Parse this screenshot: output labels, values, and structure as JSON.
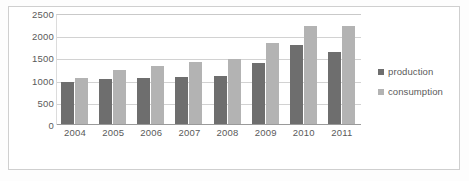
{
  "figure": {
    "background_color": "#fdfdfd",
    "frame_color": "#cfcfcf"
  },
  "chart_data": {
    "type": "bar",
    "title": "",
    "subtitle": "",
    "xlabel": "",
    "ylabel": "",
    "categories": [
      "2004",
      "2005",
      "2006",
      "2007",
      "2008",
      "2009",
      "2010",
      "2011"
    ],
    "series": [
      {
        "name": "production",
        "color": "#6e6e6e",
        "values": [
          980,
          1040,
          1070,
          1080,
          1100,
          1400,
          1800,
          1650
        ]
      },
      {
        "name": "consumption",
        "color": "#b3b3b3",
        "values": [
          1060,
          1240,
          1340,
          1430,
          1480,
          1840,
          2230,
          2220
        ]
      }
    ],
    "ylim": [
      0,
      2500
    ],
    "yticks": [
      0,
      500,
      1000,
      1500,
      2000,
      2500
    ],
    "ytick_labels": [
      "0",
      "500",
      "1000",
      "1500",
      "2000",
      "2500"
    ],
    "grid": true,
    "grid_axis": "y",
    "legend": true,
    "legend_position": "right"
  },
  "legend": {
    "entries": [
      {
        "label": "production",
        "color": "#6e6e6e"
      },
      {
        "label": "consumption",
        "color": "#b3b3b3"
      }
    ]
  }
}
